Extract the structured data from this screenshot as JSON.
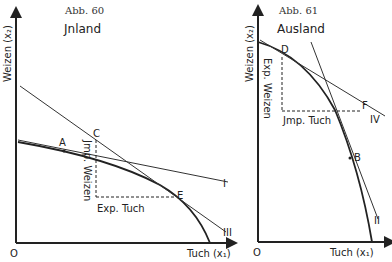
{
  "figures": [
    {
      "id": "left",
      "caption": "Abb. 60",
      "title": "Jnland",
      "y_axis_label": "Weizen (x₂)",
      "x_axis_label": "Tuch (x₁)",
      "origin_label": "O",
      "points": {
        "A": "A",
        "C": "C",
        "E": "E"
      },
      "lines": {
        "I": "I",
        "III": "III"
      },
      "annotations": {
        "import": "Jmp. Weizen",
        "export": "Exp. Tuch"
      }
    },
    {
      "id": "right",
      "caption": "Abb. 61",
      "title": "Ausland",
      "y_axis_label": "Weizen (x₂)",
      "x_axis_label": "Tuch (x₁)",
      "origin_label": "O",
      "points": {
        "D": "D",
        "F": "F",
        "B": "B"
      },
      "lines": {
        "IV": "IV",
        "II": "II"
      },
      "annotations": {
        "export": "Exp. Weizen",
        "import": "Jmp. Tuch"
      }
    }
  ],
  "colors": {
    "ink": "#222222",
    "background": "#ffffff"
  }
}
